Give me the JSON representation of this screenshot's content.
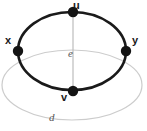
{
  "figure": {
    "colors": {
      "cycle_stroke": "#1a1a1a",
      "vertex_fill": "#141414",
      "outer_ellipse_stroke": "#c9c9c9",
      "chord_stroke": "#b8b8b8",
      "label_color": "#1a1a1a",
      "edge_label_color": "#555555",
      "background": "#ffffff"
    },
    "vertices": [
      {
        "id": "u",
        "label": "u",
        "cx": 73,
        "cy": 12,
        "r": 5.2
      },
      {
        "id": "x",
        "label": "x",
        "cx": 18,
        "cy": 51,
        "r": 5.2
      },
      {
        "id": "y",
        "label": "y",
        "cx": 126,
        "cy": 51,
        "r": 5.2
      },
      {
        "id": "v",
        "label": "v",
        "cx": 73,
        "cy": 91,
        "r": 5.2
      }
    ],
    "edges": [
      {
        "id": "e",
        "label": "e",
        "from": "u",
        "to": "v",
        "style": "straight-gray"
      },
      {
        "id": "d",
        "label": "d",
        "from": "x",
        "to": "y",
        "style": "curved-gray-below"
      }
    ],
    "cycle": {
      "shape": "ellipse",
      "cx": 72,
      "cy": 51,
      "rx": 54,
      "ry": 39,
      "stroke_width": 2.6
    },
    "outer_ellipse": {
      "shape": "ellipse",
      "cx": 72,
      "cy": 85,
      "rx": 70,
      "ry": 35,
      "stroke_width": 1.2
    }
  }
}
